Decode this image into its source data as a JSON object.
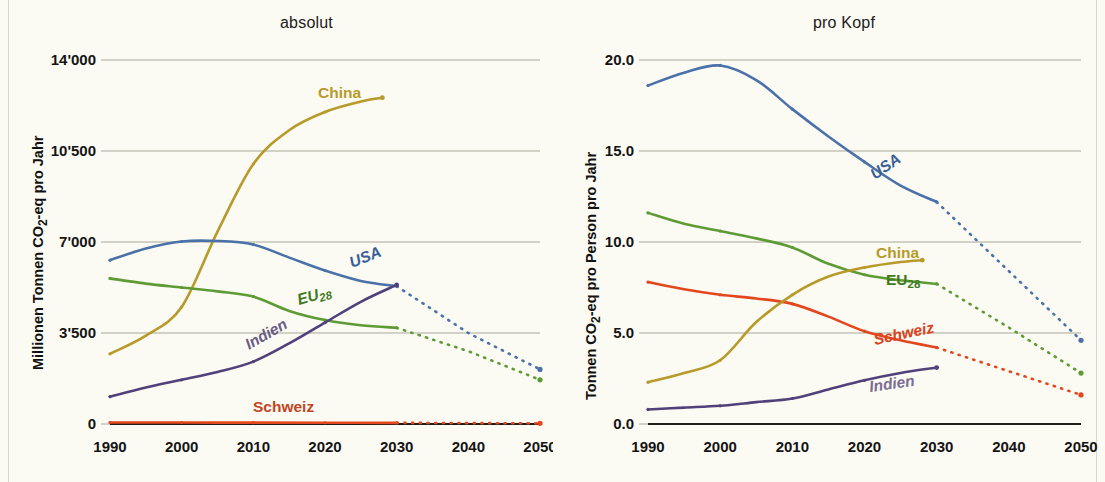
{
  "meta": {
    "background": "#fbfaf3",
    "grid_color": "#a9a79a",
    "axis_color": "#1d1d1b"
  },
  "series_colors": {
    "China": "#b79a2a",
    "USA": "#4a72a8",
    "EU28": "#5e9b34",
    "Indien": "#51417a",
    "Schweiz": "#e3471d"
  },
  "panels": {
    "left": {
      "title": "absolut",
      "ylabel": "Millionen Tonnen CO₂-eq pro Jahr",
      "ylabel_plain": "Millionen Tonnen CO2-eq pro Jahr",
      "yticks": [
        "14'000",
        "10'500",
        "7'000",
        "3'500",
        "0"
      ],
      "xticks": [
        "1990",
        "2000",
        "2010",
        "2020",
        "2030",
        "2040",
        "2050"
      ],
      "series_labels": [
        "China",
        "USA",
        "EU28",
        "Indien",
        "Schweiz"
      ]
    },
    "right": {
      "title": "pro Kopf",
      "ylabel": "Tonnen CO₂-eq pro Person pro Jahr",
      "ylabel_plain": "Tonnen CO2-eq pro Person pro Jahr",
      "yticks": [
        "20.0",
        "15.0",
        "10.0",
        "5.0",
        "0.0"
      ],
      "xticks": [
        "1990",
        "2000",
        "2010",
        "2020",
        "2030",
        "2040",
        "2050"
      ],
      "series_labels": [
        "China",
        "EU28",
        "Schweiz",
        "Indien",
        "USA"
      ]
    }
  },
  "chart_data": [
    {
      "type": "line",
      "title": "absolut",
      "xlabel": "",
      "ylabel": "Millionen Tonnen CO2-eq pro Jahr",
      "xlim": [
        1990,
        2050
      ],
      "ylim": [
        0,
        14000
      ],
      "yticks": [
        0,
        3500,
        7000,
        10500,
        14000
      ],
      "ytick_labels": [
        "0",
        "3'500",
        "7'000",
        "10'500",
        "14'000"
      ],
      "xticks": [
        1990,
        2000,
        2010,
        2020,
        2030,
        2040,
        2050
      ],
      "grid": "horizontal",
      "legend": "inline-labels",
      "history_end_year": 2030,
      "series": [
        {
          "name": "China",
          "color": "#b79a2a",
          "x": [
            1990,
            1995,
            2000,
            2005,
            2010,
            2015,
            2020,
            2025,
            2028
          ],
          "values": [
            2700,
            3400,
            4500,
            7400,
            10000,
            11300,
            12000,
            12400,
            12550
          ],
          "projection_x": [],
          "projection_values": []
        },
        {
          "name": "USA",
          "color": "#4a72a8",
          "x": [
            1990,
            1995,
            2000,
            2005,
            2010,
            2015,
            2020,
            2025,
            2030
          ],
          "values": [
            6300,
            6750,
            7020,
            7040,
            6900,
            6400,
            5900,
            5500,
            5300
          ],
          "projection_x": [
            2030,
            2040,
            2050
          ],
          "projection_values": [
            5300,
            3500,
            2100
          ]
        },
        {
          "name": "EU28",
          "color": "#5e9b34",
          "x": [
            1990,
            1995,
            2000,
            2005,
            2010,
            2015,
            2020,
            2025,
            2030
          ],
          "values": [
            5600,
            5400,
            5250,
            5100,
            4900,
            4350,
            4000,
            3800,
            3700
          ],
          "projection_x": [
            2030,
            2040,
            2050
          ],
          "projection_values": [
            3700,
            2800,
            1700
          ]
        },
        {
          "name": "Indien",
          "color": "#51417a",
          "x": [
            1990,
            1995,
            2000,
            2005,
            2010,
            2015,
            2020,
            2025,
            2030
          ],
          "values": [
            1050,
            1400,
            1700,
            2000,
            2400,
            3100,
            3900,
            4700,
            5350
          ],
          "projection_x": [],
          "projection_values": []
        },
        {
          "name": "Schweiz",
          "color": "#e3471d",
          "x": [
            1990,
            2000,
            2010,
            2020,
            2030
          ],
          "values": [
            55,
            55,
            52,
            48,
            45
          ],
          "projection_x": [
            2030,
            2040,
            2050
          ],
          "projection_values": [
            45,
            35,
            25
          ]
        }
      ]
    },
    {
      "type": "line",
      "title": "pro Kopf",
      "xlabel": "",
      "ylabel": "Tonnen CO2-eq pro Person pro Jahr",
      "xlim": [
        1990,
        2050
      ],
      "ylim": [
        0,
        20
      ],
      "yticks": [
        0,
        5,
        10,
        15,
        20
      ],
      "ytick_labels": [
        "0.0",
        "5.0",
        "10.0",
        "15.0",
        "20.0"
      ],
      "xticks": [
        1990,
        2000,
        2010,
        2020,
        2030,
        2040,
        2050
      ],
      "grid": "horizontal",
      "legend": "inline-labels",
      "history_end_year": 2030,
      "series": [
        {
          "name": "USA",
          "color": "#4a72a8",
          "x": [
            1990,
            1995,
            2000,
            2005,
            2010,
            2015,
            2020,
            2025,
            2030
          ],
          "values": [
            18.6,
            19.3,
            19.7,
            18.9,
            17.3,
            15.8,
            14.4,
            13.1,
            12.2
          ],
          "projection_x": [
            2030,
            2040,
            2050
          ],
          "projection_values": [
            12.2,
            8.4,
            4.6
          ]
        },
        {
          "name": "EU28",
          "color": "#5e9b34",
          "x": [
            1990,
            1995,
            2000,
            2005,
            2010,
            2015,
            2020,
            2025,
            2030
          ],
          "values": [
            11.6,
            11.0,
            10.6,
            10.2,
            9.7,
            8.8,
            8.2,
            7.9,
            7.7
          ],
          "projection_x": [
            2030,
            2040,
            2050
          ],
          "projection_values": [
            7.7,
            5.3,
            2.8
          ]
        },
        {
          "name": "Schweiz",
          "color": "#e3471d",
          "x": [
            1990,
            1995,
            2000,
            2005,
            2010,
            2015,
            2020,
            2025,
            2030
          ],
          "values": [
            7.8,
            7.4,
            7.1,
            6.9,
            6.6,
            5.9,
            5.1,
            4.6,
            4.2
          ],
          "projection_x": [
            2030,
            2040,
            2050
          ],
          "projection_values": [
            4.2,
            2.9,
            1.6
          ]
        },
        {
          "name": "China",
          "color": "#b79a2a",
          "x": [
            1990,
            1995,
            2000,
            2005,
            2010,
            2015,
            2020,
            2025,
            2028
          ],
          "values": [
            2.3,
            2.8,
            3.5,
            5.6,
            7.1,
            8.1,
            8.6,
            8.9,
            9.0
          ],
          "projection_x": [],
          "projection_values": []
        },
        {
          "name": "Indien",
          "color": "#51417a",
          "x": [
            1990,
            1995,
            2000,
            2005,
            2010,
            2015,
            2020,
            2025,
            2030
          ],
          "values": [
            0.8,
            0.9,
            1.0,
            1.2,
            1.4,
            1.9,
            2.4,
            2.8,
            3.1
          ],
          "projection_x": [],
          "projection_values": []
        }
      ]
    }
  ]
}
